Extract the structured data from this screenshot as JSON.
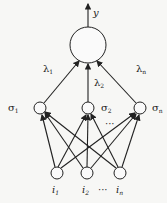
{
  "diagram": {
    "type": "neural-network",
    "output": {
      "label": "y"
    },
    "output_node": {
      "cx": 88,
      "cy": 45,
      "r": 18
    },
    "weights": [
      {
        "label": "λ",
        "sub": "1",
        "x": 43,
        "y": 72
      },
      {
        "label": "λ",
        "sub": "2",
        "x": 94,
        "y": 86
      },
      {
        "label": "λ",
        "sub": "n",
        "x": 136,
        "y": 72
      }
    ],
    "hidden": [
      {
        "label": "σ",
        "sub": "1",
        "cx": 40,
        "cy": 108,
        "lx": 8,
        "ly": 111
      },
      {
        "label": "σ",
        "sub": "2",
        "cx": 88,
        "cy": 108,
        "lx": 103,
        "ly": 111
      },
      {
        "label": "σ",
        "sub": "n",
        "cx": 140,
        "cy": 108,
        "lx": 154,
        "ly": 111
      }
    ],
    "hidden_ellipsis": "···",
    "inputs": [
      {
        "label": "i",
        "sub": "1",
        "cx": 57,
        "cy": 173
      },
      {
        "label": "i",
        "sub": "2",
        "cx": 87,
        "cy": 173
      },
      {
        "label": "i",
        "sub": "n",
        "cx": 120,
        "cy": 173
      }
    ],
    "input_ellipsis": "···"
  }
}
